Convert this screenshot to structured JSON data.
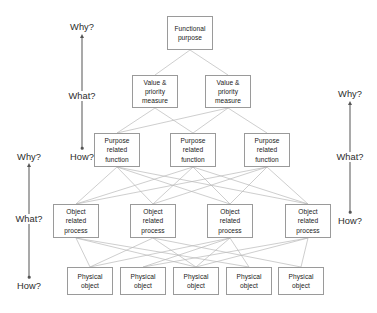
{
  "diagram": {
    "canvas": {
      "width": 377,
      "height": 313
    },
    "colors": {
      "background": "#ffffff",
      "node_border": "#9a9a9a",
      "node_fill": "#ffffff",
      "node_text": "#1a1a1a",
      "edge": "#b9b9b9",
      "axis": "#555555",
      "axis_text": "#2b2b2b"
    },
    "levels": [
      {
        "id": "functional-purpose",
        "label": "Functional\npurpose",
        "count": 1,
        "nodes": [
          {
            "label": "Functional\npurpose",
            "x": 167,
            "y": 16,
            "w": 46,
            "h": 34
          }
        ]
      },
      {
        "id": "value-priority-measure",
        "label": "Value &\npriority\nmeasure",
        "count": 2,
        "nodes": [
          {
            "label": "Value &\npriority\nmeasure",
            "x": 132,
            "y": 75,
            "w": 46,
            "h": 33
          },
          {
            "label": "Value &\npriority\nmeasure",
            "x": 205,
            "y": 75,
            "w": 46,
            "h": 33
          }
        ]
      },
      {
        "id": "purpose-related-function",
        "label": "Purpose\nrelated\nfunction",
        "count": 3,
        "nodes": [
          {
            "label": "Purpose\nrelated\nfunction",
            "x": 94,
            "y": 133,
            "w": 46,
            "h": 34
          },
          {
            "label": "Purpose\nrelated\nfunction",
            "x": 170,
            "y": 133,
            "w": 46,
            "h": 34
          },
          {
            "label": "Purpose\nrelated\nfunction",
            "x": 244,
            "y": 133,
            "w": 46,
            "h": 34
          }
        ]
      },
      {
        "id": "object-related-process",
        "label": "Object\nrelated\nprocess",
        "count": 4,
        "nodes": [
          {
            "label": "Object\nrelated\nprocess",
            "x": 53,
            "y": 204,
            "w": 46,
            "h": 34
          },
          {
            "label": "Object\nrelated\nprocess",
            "x": 130,
            "y": 204,
            "w": 46,
            "h": 34
          },
          {
            "label": "Object\nrelated\nprocess",
            "x": 207,
            "y": 204,
            "w": 46,
            "h": 34
          },
          {
            "label": "Object\nrelated\nprocess",
            "x": 285,
            "y": 204,
            "w": 46,
            "h": 34
          }
        ]
      },
      {
        "id": "physical-object",
        "label": "Physical\nobject",
        "count": 5,
        "nodes": [
          {
            "label": "Physical\nobject",
            "x": 67,
            "y": 267,
            "w": 46,
            "h": 28
          },
          {
            "label": "Physical\nobject",
            "x": 120,
            "y": 267,
            "w": 46,
            "h": 28
          },
          {
            "label": "Physical\nobject",
            "x": 173,
            "y": 267,
            "w": 46,
            "h": 28
          },
          {
            "label": "Physical\nobject",
            "x": 226,
            "y": 267,
            "w": 46,
            "h": 28
          },
          {
            "label": "Physical\nobject",
            "x": 278,
            "y": 267,
            "w": 46,
            "h": 28
          }
        ]
      }
    ],
    "edges": [
      {
        "from": [
          0,
          0
        ],
        "to": [
          1,
          0
        ]
      },
      {
        "from": [
          0,
          0
        ],
        "to": [
          1,
          1
        ]
      },
      {
        "from": [
          1,
          0
        ],
        "to": [
          2,
          0
        ]
      },
      {
        "from": [
          1,
          0
        ],
        "to": [
          2,
          1
        ]
      },
      {
        "from": [
          1,
          1
        ],
        "to": [
          2,
          0
        ]
      },
      {
        "from": [
          1,
          1
        ],
        "to": [
          2,
          1
        ]
      },
      {
        "from": [
          1,
          1
        ],
        "to": [
          2,
          2
        ]
      },
      {
        "from": [
          2,
          0
        ],
        "to": [
          3,
          0
        ]
      },
      {
        "from": [
          2,
          0
        ],
        "to": [
          3,
          1
        ]
      },
      {
        "from": [
          2,
          0
        ],
        "to": [
          3,
          2
        ]
      },
      {
        "from": [
          2,
          0
        ],
        "to": [
          3,
          3
        ]
      },
      {
        "from": [
          2,
          1
        ],
        "to": [
          3,
          0
        ]
      },
      {
        "from": [
          2,
          1
        ],
        "to": [
          3,
          1
        ]
      },
      {
        "from": [
          2,
          1
        ],
        "to": [
          3,
          2
        ]
      },
      {
        "from": [
          2,
          1
        ],
        "to": [
          3,
          3
        ]
      },
      {
        "from": [
          2,
          2
        ],
        "to": [
          3,
          0
        ]
      },
      {
        "from": [
          2,
          2
        ],
        "to": [
          3,
          1
        ]
      },
      {
        "from": [
          2,
          2
        ],
        "to": [
          3,
          2
        ]
      },
      {
        "from": [
          2,
          2
        ],
        "to": [
          3,
          3
        ]
      },
      {
        "from": [
          3,
          0
        ],
        "to": [
          4,
          0
        ]
      },
      {
        "from": [
          3,
          0
        ],
        "to": [
          4,
          2
        ]
      },
      {
        "from": [
          3,
          0
        ],
        "to": [
          4,
          3
        ]
      },
      {
        "from": [
          3,
          1
        ],
        "to": [
          4,
          0
        ]
      },
      {
        "from": [
          3,
          1
        ],
        "to": [
          4,
          2
        ]
      },
      {
        "from": [
          3,
          1
        ],
        "to": [
          4,
          4
        ]
      },
      {
        "from": [
          3,
          2
        ],
        "to": [
          4,
          0
        ]
      },
      {
        "from": [
          3,
          2
        ],
        "to": [
          4,
          1
        ]
      },
      {
        "from": [
          3,
          2
        ],
        "to": [
          4,
          2
        ]
      },
      {
        "from": [
          3,
          2
        ],
        "to": [
          4,
          3
        ]
      },
      {
        "from": [
          3,
          3
        ],
        "to": [
          4,
          1
        ]
      },
      {
        "from": [
          3,
          3
        ],
        "to": [
          4,
          2
        ]
      },
      {
        "from": [
          3,
          3
        ],
        "to": [
          4,
          4
        ]
      }
    ],
    "axes": [
      {
        "id": "axis-left-outer",
        "x": 29,
        "top_label": "Why?",
        "mid_label": "What?",
        "bottom_label": "How?",
        "top_label_y": 152,
        "mid_label_y": 214,
        "bottom_label_y": 281,
        "line_top": 167,
        "line_bottom": 277
      },
      {
        "id": "axis-left-inner",
        "x": 82,
        "top_label": "Why?",
        "mid_label": "What?",
        "bottom_label": "How?",
        "top_label_y": 22,
        "mid_label_y": 91,
        "bottom_label_y": 152,
        "line_top": 38,
        "line_bottom": 148
      },
      {
        "id": "axis-right",
        "x": 350,
        "top_label": "Why?",
        "mid_label": "What?",
        "bottom_label": "How?",
        "top_label_y": 89,
        "mid_label_y": 152,
        "bottom_label_y": 216,
        "line_top": 105,
        "line_bottom": 212
      }
    ]
  }
}
